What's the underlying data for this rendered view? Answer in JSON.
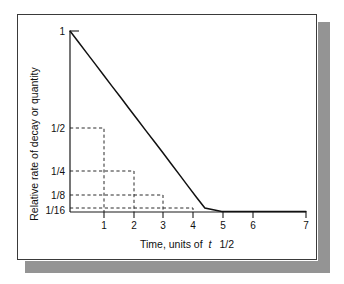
{
  "figure": {
    "background_color": "#ffffff",
    "frame_border_color": "#3a3a3a",
    "shadow_color": "#949494",
    "curve_color": "#111111",
    "guide_color": "#2b2b2b"
  },
  "chart_data": {
    "type": "line",
    "title": "",
    "subtitle": "",
    "xlabel_parts": {
      "pre": "Time, units of",
      "italic": "t",
      "post": "1/2"
    },
    "xlabel": "Time, units of t 1/2",
    "ylabel": "Relative rate of decay or quantity",
    "xlim": [
      0,
      7
    ],
    "ylim": [
      0,
      1
    ],
    "grid": false,
    "legend": "none",
    "x_tick_values": [
      1,
      2,
      3,
      4,
      5,
      6,
      7
    ],
    "x_tick_labels": [
      "1",
      "2",
      "3",
      "4",
      "5",
      "6",
      "7"
    ],
    "y_tick_values": [
      1,
      0.5,
      0.25,
      0.125,
      0.0625
    ],
    "y_tick_labels": [
      "1",
      "1/2",
      "1/4",
      "1/8",
      "1/16"
    ],
    "series": [
      {
        "name": "Exponential decay",
        "formula": "y = (1/2)^x",
        "x": [
          0,
          0.25,
          0.5,
          0.75,
          1,
          1.25,
          1.5,
          1.75,
          2,
          2.25,
          2.5,
          2.75,
          3,
          3.25,
          3.5,
          3.75,
          4,
          4.5,
          5,
          5.5,
          6,
          6.5,
          7
        ],
        "values": [
          1,
          0.841,
          0.707,
          0.595,
          0.5,
          0.42,
          0.354,
          0.297,
          0.25,
          0.21,
          0.177,
          0.149,
          0.125,
          0.105,
          0.088,
          0.074,
          0.0625,
          0.044,
          0.031,
          0.022,
          0.0156,
          0.011,
          0.0078
        ]
      }
    ],
    "annotations": [
      {
        "label": "half-life 1",
        "x": 1,
        "y": 0.5,
        "guide": "dashed-to-axes"
      },
      {
        "label": "half-life 2",
        "x": 2,
        "y": 0.25,
        "guide": "dashed-to-axes"
      },
      {
        "label": "half-life 3",
        "x": 3,
        "y": 0.125,
        "guide": "dashed-to-axes"
      },
      {
        "label": "half-life 4",
        "x": 4,
        "y": 0.0625,
        "guide": "dashed-to-axes"
      }
    ]
  }
}
